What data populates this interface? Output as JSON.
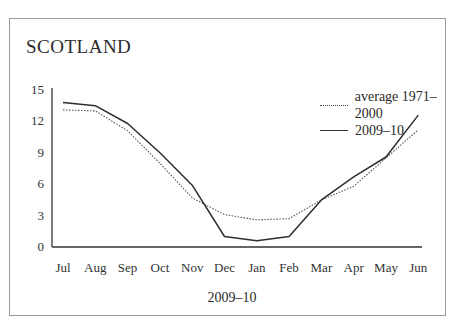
{
  "title": "SCOTLAND",
  "xlabel": "2009–10",
  "legend": [
    {
      "label": "average 1971–2000",
      "style": "dotted"
    },
    {
      "label": "2009–10",
      "style": "solid"
    }
  ],
  "chart_data": {
    "type": "line",
    "title": "SCOTLAND",
    "xlabel": "2009–10",
    "ylabel": "",
    "categories": [
      "Jul",
      "Aug",
      "Sep",
      "Oct",
      "Nov",
      "Dec",
      "Jan",
      "Feb",
      "Mar",
      "Apr",
      "May",
      "Jun"
    ],
    "yticks": [
      0,
      3,
      6,
      9,
      12,
      15
    ],
    "ylim": [
      0,
      15
    ],
    "grid": false,
    "legend_position": "upper right",
    "series": [
      {
        "name": "average 1971–2000",
        "style": "dotted",
        "values": [
          13.1,
          13.0,
          11.1,
          8.0,
          4.7,
          3.1,
          2.6,
          2.7,
          4.5,
          5.8,
          8.5,
          11.2
        ]
      },
      {
        "name": "2009–10",
        "style": "solid",
        "values": [
          13.8,
          13.5,
          11.8,
          9.0,
          5.9,
          1.0,
          0.6,
          1.0,
          4.5,
          6.7,
          8.6,
          12.6
        ]
      }
    ]
  }
}
